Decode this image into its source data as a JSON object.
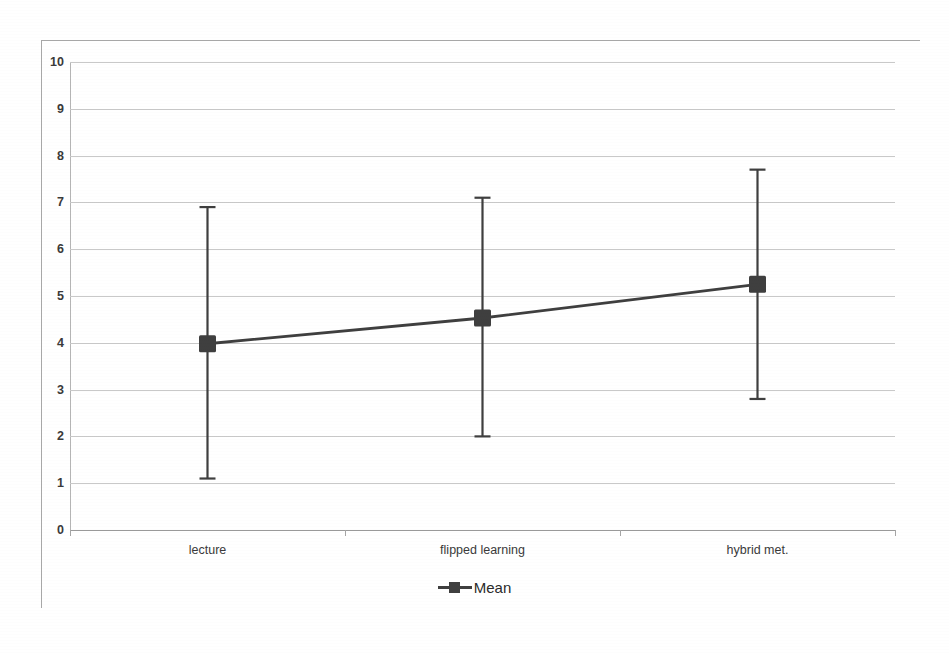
{
  "chart_data": {
    "type": "line",
    "title": "",
    "subtitle": "",
    "xlabel": "",
    "ylabel": "",
    "categories": [
      "lecture",
      "flipped learning",
      "hybrid met."
    ],
    "series": [
      {
        "name": "Mean",
        "values": [
          3.98,
          4.53,
          5.25
        ],
        "error_low": [
          1.1,
          2.0,
          2.8
        ],
        "error_high": [
          6.9,
          7.1,
          7.7
        ],
        "color": "#3f3f3f",
        "marker": "square"
      }
    ],
    "ylim": [
      0,
      10
    ],
    "ytick_step": 1,
    "ytick_labels": [
      "0",
      "1",
      "2",
      "3",
      "4",
      "5",
      "6",
      "7",
      "8",
      "9",
      "10"
    ],
    "grid": true,
    "grid_color": "#c9c9c9",
    "legend_position": "bottom",
    "legend_entries": [
      "Mean"
    ],
    "annotations": []
  },
  "legend": {
    "mean_label": "Mean"
  },
  "axes": {
    "y_labels": [
      "0",
      "1",
      "2",
      "3",
      "4",
      "5",
      "6",
      "7",
      "8",
      "9",
      "10"
    ],
    "x_labels": [
      "lecture",
      "flipped learning",
      "hybrid met."
    ]
  }
}
